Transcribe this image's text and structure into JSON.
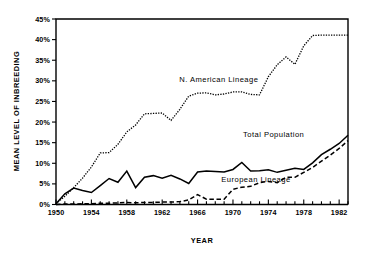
{
  "chart_data": {
    "type": "line",
    "title": "",
    "xlabel": "YEAR",
    "ylabel": "MEAN LEVEL OF INBREEDING",
    "xlim": [
      1950,
      1983
    ],
    "ylim": [
      0,
      45
    ],
    "grid": false,
    "legend_position": "inline-annotations",
    "x_tick_labels": [
      "1950",
      "1954",
      "1958",
      "1962",
      "1966",
      "1970",
      "1974",
      "1978",
      "1982"
    ],
    "x_tick_values": [
      1950,
      1954,
      1958,
      1962,
      1966,
      1970,
      1974,
      1978,
      1982
    ],
    "x_minor_tick_interval": 1,
    "y_tick_labels": [
      "0%",
      "5%",
      "10%",
      "15%",
      "20%",
      "25%",
      "30%",
      "35%",
      "40%",
      "45%"
    ],
    "y_tick_values": [
      0,
      5,
      10,
      15,
      20,
      25,
      30,
      35,
      40,
      45
    ],
    "x": [
      1950,
      1951,
      1952,
      1953,
      1954,
      1955,
      1956,
      1957,
      1958,
      1959,
      1960,
      1961,
      1962,
      1963,
      1964,
      1965,
      1966,
      1967,
      1968,
      1969,
      1970,
      1971,
      1972,
      1973,
      1974,
      1975,
      1976,
      1977,
      1978,
      1979,
      1980,
      1981,
      1982,
      1983
    ],
    "series": [
      {
        "name": "N. American Lineage",
        "style": "dotted",
        "label_x": 1968.4,
        "label_y": 29.6,
        "values": [
          0.2,
          2.0,
          4.1,
          6.4,
          9.1,
          12.5,
          12.6,
          14.6,
          17.6,
          19.3,
          22.0,
          22.1,
          22.2,
          20.4,
          23.1,
          26.3,
          27.0,
          27.1,
          26.6,
          26.8,
          27.3,
          27.3,
          26.7,
          26.6,
          31.0,
          33.9,
          35.8,
          34.0,
          38.5,
          41.0,
          41.1,
          41.1,
          41.1,
          41.1
        ]
      },
      {
        "name": "Total Population",
        "style": "solid",
        "label_x": 1974.6,
        "label_y": 16.4,
        "values": [
          0.2,
          2.6,
          4.0,
          3.4,
          2.9,
          4.6,
          6.3,
          5.4,
          8.1,
          4.1,
          6.6,
          7.0,
          6.4,
          7.1,
          6.2,
          5.1,
          7.9,
          8.1,
          8.0,
          7.9,
          8.5,
          10.2,
          8.1,
          8.2,
          8.4,
          7.8,
          8.3,
          8.8,
          8.5,
          10.1,
          12.1,
          13.4,
          14.8,
          16.8
        ]
      },
      {
        "name": "European Lineage",
        "style": "dashed",
        "label_x": 1972.6,
        "label_y": 5.4,
        "values": [
          0.0,
          0.1,
          0.1,
          0.2,
          0.2,
          0.3,
          0.3,
          0.4,
          0.5,
          0.4,
          0.5,
          0.5,
          0.6,
          0.6,
          0.7,
          1.1,
          2.4,
          1.3,
          1.3,
          1.3,
          3.7,
          4.2,
          4.4,
          5.3,
          5.6,
          5.3,
          6.6,
          6.6,
          7.8,
          9.0,
          10.5,
          12.0,
          13.6,
          15.5
        ]
      }
    ]
  },
  "axes": {
    "y_title": "MEAN LEVEL OF INBREEDING",
    "x_title": "YEAR"
  }
}
